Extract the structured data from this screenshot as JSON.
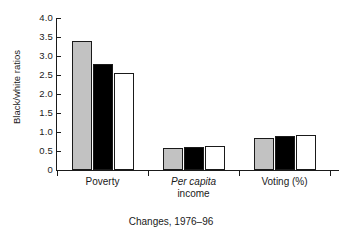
{
  "chart_data": {
    "type": "bar",
    "title": "",
    "subtitle": "",
    "xlabel": "Changes, 1976–96",
    "ylabel": "Black/white ratios",
    "categories": [
      "Poverty",
      "Per capita income",
      "Voting (%)"
    ],
    "category_labels": [
      {
        "line1": "Poverty",
        "line1_italic": false,
        "line2": ""
      },
      {
        "line1": "Per capita",
        "line1_italic": true,
        "line2": "income"
      },
      {
        "line1": "Voting (%)",
        "line1_italic": false,
        "line2": ""
      }
    ],
    "series": [
      {
        "name": "series-1",
        "color": "#c2c2c2",
        "values": [
          3.39,
          0.57,
          0.84
        ]
      },
      {
        "name": "series-2",
        "color": "#000000",
        "values": [
          2.78,
          0.6,
          0.9
        ]
      },
      {
        "name": "series-3",
        "color": "#ffffff",
        "values": [
          2.54,
          0.63,
          0.93
        ]
      }
    ],
    "ylim": [
      0,
      4.0
    ],
    "yticks": [
      0,
      0.5,
      1.0,
      1.5,
      2.0,
      2.5,
      3.0,
      3.5,
      4.0
    ],
    "ytick_labels": [
      "0",
      "0.5",
      "1.0",
      "1.5",
      "2.0",
      "2.5",
      "3.0",
      "3.5",
      "4.0"
    ],
    "grid": false,
    "legend": "none",
    "bar_outline_color": "#1a1a1a",
    "axis_color": "#1a1a1a",
    "background": "#ffffff"
  }
}
